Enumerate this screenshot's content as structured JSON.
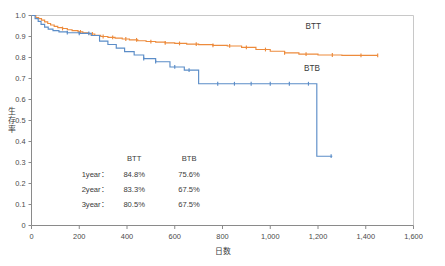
{
  "chart_data": {
    "type": "line",
    "title": "",
    "xlabel": "日数",
    "ylabel": "生存率",
    "xlim": [
      0,
      1600
    ],
    "ylim": [
      0,
      1.0
    ],
    "xticks": [
      "0",
      "200",
      "400",
      "600",
      "800",
      "1,000",
      "1,200",
      "1,400",
      "1,600"
    ],
    "xtick_values": [
      0,
      200,
      400,
      600,
      800,
      1000,
      1200,
      1400,
      1600
    ],
    "yticks": [
      "0",
      "0.1",
      "0.2",
      "0.3",
      "0.4",
      "0.5",
      "0.6",
      "0.7",
      "0.8",
      "0.9",
      "1.0"
    ],
    "ytick_values": [
      0,
      0.1,
      0.2,
      0.3,
      0.4,
      0.5,
      0.6,
      0.7,
      0.8,
      0.9,
      1.0
    ],
    "grid": false,
    "legend_position": "inline-right",
    "series": [
      {
        "name": "BTT",
        "color": "#ED8B3C",
        "label_x": 1180,
        "label_y": 0.935,
        "points": [
          [
            0,
            1.0
          ],
          [
            18,
            0.99
          ],
          [
            30,
            0.985
          ],
          [
            42,
            0.978
          ],
          [
            55,
            0.97
          ],
          [
            68,
            0.962
          ],
          [
            80,
            0.955
          ],
          [
            95,
            0.948
          ],
          [
            110,
            0.942
          ],
          [
            130,
            0.938
          ],
          [
            150,
            0.932
          ],
          [
            170,
            0.928
          ],
          [
            195,
            0.922
          ],
          [
            215,
            0.918
          ],
          [
            240,
            0.912
          ],
          [
            265,
            0.906
          ],
          [
            290,
            0.9
          ],
          [
            320,
            0.896
          ],
          [
            350,
            0.892
          ],
          [
            380,
            0.888
          ],
          [
            410,
            0.884
          ],
          [
            445,
            0.88
          ],
          [
            480,
            0.876
          ],
          [
            520,
            0.873
          ],
          [
            560,
            0.87
          ],
          [
            600,
            0.867
          ],
          [
            650,
            0.864
          ],
          [
            700,
            0.861
          ],
          [
            760,
            0.858
          ],
          [
            820,
            0.855
          ],
          [
            880,
            0.848
          ],
          [
            940,
            0.838
          ],
          [
            1000,
            0.83
          ],
          [
            1060,
            0.822
          ],
          [
            1120,
            0.816
          ],
          [
            1200,
            0.812
          ],
          [
            1300,
            0.81
          ],
          [
            1450,
            0.81
          ]
        ],
        "censor_x": [
          130,
          205,
          255,
          300,
          340,
          395,
          440,
          500,
          560,
          620,
          690,
          760,
          830,
          900,
          980,
          1060,
          1150,
          1260,
          1380,
          1450
        ]
      },
      {
        "name": "BTB",
        "color": "#5B8DC8",
        "label_x": 1175,
        "label_y": 0.735,
        "points": [
          [
            0,
            1.0
          ],
          [
            15,
            0.985
          ],
          [
            28,
            0.972
          ],
          [
            40,
            0.958
          ],
          [
            55,
            0.945
          ],
          [
            70,
            0.935
          ],
          [
            90,
            0.928
          ],
          [
            115,
            0.922
          ],
          [
            150,
            0.918
          ],
          [
            200,
            0.915
          ],
          [
            250,
            0.905
          ],
          [
            285,
            0.878
          ],
          [
            320,
            0.862
          ],
          [
            355,
            0.845
          ],
          [
            390,
            0.828
          ],
          [
            430,
            0.812
          ],
          [
            470,
            0.795
          ],
          [
            520,
            0.78
          ],
          [
            580,
            0.755
          ],
          [
            640,
            0.74
          ],
          [
            700,
            0.675
          ],
          [
            820,
            0.675
          ],
          [
            950,
            0.675
          ],
          [
            1080,
            0.675
          ],
          [
            1195,
            0.675
          ],
          [
            1195,
            0.33
          ],
          [
            1260,
            0.33
          ]
        ],
        "censor_x": [
          150,
          200,
          240,
          470,
          520,
          600,
          660,
          780,
          850,
          920,
          1000,
          1080,
          1160,
          1255
        ]
      }
    ],
    "annotation_table": {
      "columns": [
        "",
        "BTT",
        "BTB"
      ],
      "rows": [
        [
          "1year：",
          "84.8%",
          "75.6%"
        ],
        [
          "2year：",
          "83.3%",
          "67.5%"
        ],
        [
          "3year：",
          "80.5%",
          "67.5%"
        ]
      ]
    }
  },
  "colors": {
    "btt": "#ED8B3C",
    "btb": "#5B8DC8",
    "axis": "#8a8a8a",
    "frame": "#c8c8c8",
    "text": "#3a3a3a"
  }
}
